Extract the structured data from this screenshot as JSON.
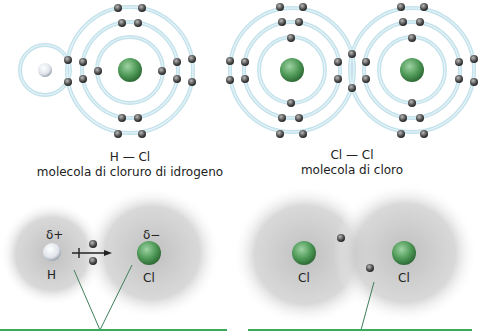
{
  "colors": {
    "shell": "#bfe0ea",
    "nucleus_cl": "#4f9a58",
    "nucleus_h": "#e8ecf0",
    "electron": "#555555",
    "baseline": "#3aaa5c",
    "cloud": "#9a9a9a"
  },
  "top_left": {
    "formula": "H — Cl",
    "caption": "molecola di cloruro di idrogeno"
  },
  "top_right": {
    "formula": "Cl — Cl",
    "caption": "molecola di cloro"
  },
  "bottom_left": {
    "atom_left": "H",
    "atom_right": "Cl",
    "charge_left": "δ+",
    "charge_right": "δ−"
  },
  "bottom_right": {
    "atom_left": "Cl",
    "atom_right": "Cl"
  }
}
